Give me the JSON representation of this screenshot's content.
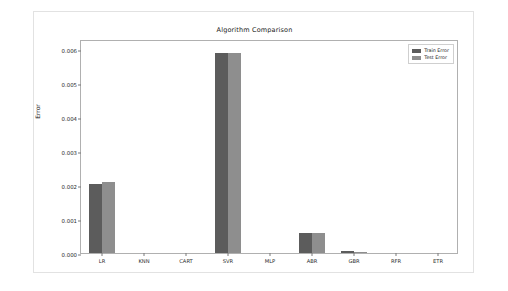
{
  "figure": {
    "title": "Algorithm Comparison"
  },
  "chart_data": {
    "type": "bar",
    "title": "Algorithm Comparison",
    "xlabel": "",
    "ylabel": "Error",
    "categories": [
      "LR",
      "KNN",
      "CART",
      "SVR",
      "MLP",
      "ABR",
      "GBR",
      "RFR",
      "ETR"
    ],
    "series": [
      {
        "name": "Train Error",
        "color": "#5c5c5c",
        "values": [
          0.00202,
          0.0,
          0.0,
          0.00588,
          0.0,
          0.00058,
          5e-05,
          0.0,
          0.0
        ]
      },
      {
        "name": "Test Error",
        "color": "#8e8e8e",
        "values": [
          0.00208,
          0.0,
          0.0,
          0.0059,
          0.0,
          0.00058,
          4e-05,
          0.0,
          0.0
        ]
      }
    ],
    "ylim": [
      0.0,
      0.0063
    ],
    "yticks": [
      "0.000",
      "0.001",
      "0.002",
      "0.003",
      "0.004",
      "0.005",
      "0.006"
    ],
    "ytick_values": [
      0.0,
      0.001,
      0.002,
      0.003,
      0.004,
      0.005,
      0.006
    ],
    "grid": false,
    "legend_position": "upper right",
    "legend": [
      "Train Error",
      "Test Error"
    ]
  }
}
